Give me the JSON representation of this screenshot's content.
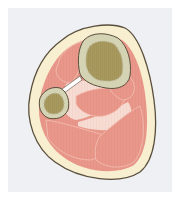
{
  "figure": {
    "labels": [],
    "colors": {
      "background": "#eef0f3",
      "skin_outline": "#5a4e3c",
      "subcutaneous": "#f7efcf",
      "muscle": "#e8978a",
      "muscle_light": "#f1b8a8",
      "fascia": "#f6dcd3",
      "bone_cortex": "#d4d3b4",
      "bone_marrow": "#a89a5e",
      "interosseous_membrane": "#ffffff"
    },
    "structures": [
      {
        "name": "tibia"
      },
      {
        "name": "fibula"
      },
      {
        "name": "interosseous-membrane"
      },
      {
        "name": "anterior-muscles"
      },
      {
        "name": "lateral-muscles"
      },
      {
        "name": "posterior-deep-muscles"
      },
      {
        "name": "posterior-superficial-muscles"
      },
      {
        "name": "subcutaneous-layer"
      }
    ]
  }
}
